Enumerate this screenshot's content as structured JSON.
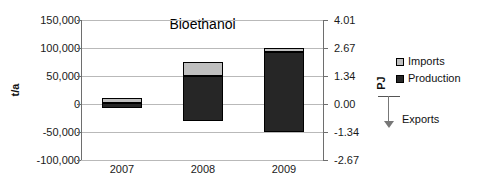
{
  "chart_data": {
    "type": "bar",
    "title": "Bioethanol",
    "xlabel": "",
    "ylabel": "t/a",
    "y2label": "PJ",
    "categories": [
      "2007",
      "2008",
      "2009"
    ],
    "series": [
      {
        "name": "Imports",
        "values": [
          10000,
          25000,
          7000
        ]
      },
      {
        "name": "Production",
        "values": [
          -8000,
          -30000,
          -50000
        ]
      }
    ],
    "stack_tops": [
      10000,
      75000,
      100000
    ],
    "stack_bottoms": [
      -8000,
      -30000,
      -50000
    ],
    "production_tops": [
      2000,
      50000,
      93000
    ],
    "ylim": [
      -100000,
      150000
    ],
    "yticks": [
      "150,000",
      "100,000",
      "50,000",
      "0",
      "-50,000",
      "-100,000"
    ],
    "ytick_values": [
      150000,
      100000,
      50000,
      0,
      -50000,
      -100000
    ],
    "y2lim": [
      -2.67,
      4.01
    ],
    "y2ticks": [
      "4.01",
      "2.67",
      "1.34",
      "0.00",
      "-1.34",
      "-2.67"
    ],
    "y2tick_values": [
      4.01,
      2.67,
      1.34,
      0.0,
      -1.34,
      -2.67
    ],
    "grid": true,
    "legend_position": "right",
    "legend": [
      "Imports",
      "Production"
    ],
    "annotation": {
      "text": "Exports",
      "direction": "down",
      "from_value": 0.0
    },
    "colors": {
      "imports": "#bfbfbf",
      "production": "#262626",
      "grid": "#b9b9b9",
      "axis": "#6e6e6e",
      "text": "#111111"
    }
  }
}
